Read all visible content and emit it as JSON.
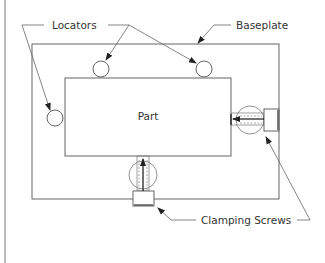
{
  "diagram": {
    "type": "fixture-layout",
    "labels": {
      "locators": "Locators",
      "baseplate": "Baseplate",
      "part": "Part",
      "clamping_screws": "Clamping Screws"
    },
    "components": {
      "baseplate": {
        "x": 32,
        "y": 44,
        "w": 247,
        "h": 155
      },
      "part": {
        "x": 65,
        "y": 78,
        "w": 166,
        "h": 78
      },
      "locators": [
        {
          "cx": 101,
          "cy": 69,
          "r": 8
        },
        {
          "cx": 204,
          "cy": 69,
          "r": 8
        },
        {
          "cx": 55,
          "cy": 118,
          "r": 8
        }
      ],
      "clamps": [
        {
          "position": "right",
          "direction": "left"
        },
        {
          "position": "bottom",
          "direction": "up"
        }
      ]
    },
    "colors": {
      "line": "#555555",
      "text": "#333333",
      "background": "#ffffff"
    }
  }
}
